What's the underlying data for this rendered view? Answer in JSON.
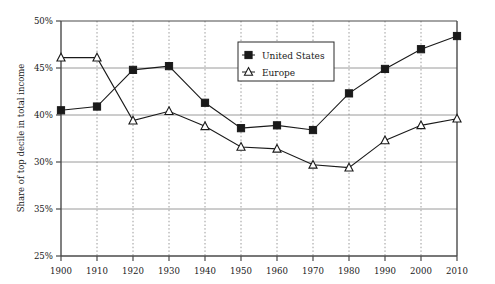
{
  "chart_data": {
    "type": "line",
    "title": "",
    "subtitle": "",
    "xlabel": "",
    "ylabel": "Share of top decile in total income",
    "x": [
      1900,
      1910,
      1920,
      1930,
      1940,
      1950,
      1960,
      1970,
      1980,
      1990,
      2000,
      2010
    ],
    "xtick_labels": [
      "1900",
      "1910",
      "1920",
      "1930",
      "1940",
      "1950",
      "1960",
      "1970",
      "1980",
      "1990",
      "2000",
      "2010"
    ],
    "ytick_labels": [
      "50%",
      "45%",
      "40%",
      "30%",
      "35%",
      "25%"
    ],
    "ytick_values": [
      50,
      45,
      40,
      35,
      30,
      25
    ],
    "ylim": [
      25,
      50
    ],
    "xlim": [
      1900,
      2010
    ],
    "grid": true,
    "grid_vertical": true,
    "legend_position": "top-center",
    "series": [
      {
        "name": "United States",
        "marker": "filled-square",
        "color": "#1a1a1a",
        "values": [
          40.5,
          40.9,
          44.8,
          45.2,
          41.3,
          38.6,
          38.9,
          38.4,
          42.3,
          44.9,
          47.0,
          48.4
        ]
      },
      {
        "name": "Europe",
        "marker": "open-triangle",
        "color": "#1a1a1a",
        "values": [
          46.1,
          46.1,
          39.4,
          40.4,
          38.8,
          36.6,
          36.4,
          34.7,
          34.4,
          37.3,
          38.9,
          39.6
        ]
      }
    ]
  },
  "legend": {
    "entries": [
      {
        "label": "United States",
        "marker": "filled-square"
      },
      {
        "label": "Europe",
        "marker": "open-triangle"
      }
    ]
  },
  "axes": {
    "y_axis_title": "Share of top decile in total income"
  }
}
